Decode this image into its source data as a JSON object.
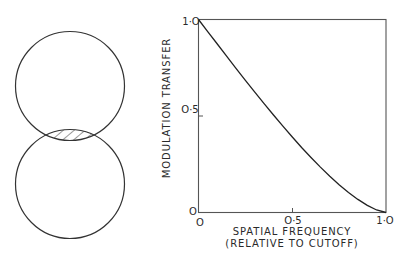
{
  "diagram": {
    "top_circle": {
      "cx": 70,
      "cy": 86,
      "r": 54.5
    },
    "bottom_circle": {
      "cx": 70,
      "cy": 184,
      "r": 54.5
    },
    "overlap_fill": "hatched",
    "stroke_color": "#333333"
  },
  "chart_data": {
    "type": "line",
    "title": "",
    "xlabel": "SPATIAL FREQUENCY",
    "xlabel_line2": "(RELATIVE TO CUTOFF)",
    "ylabel": "MODULATION TRANSFER",
    "xlim": [
      0,
      1
    ],
    "ylim": [
      0,
      1
    ],
    "grid": false,
    "x_ticks": [
      {
        "value": 0,
        "label": "O"
      },
      {
        "value": 0.5,
        "label": "O·5"
      },
      {
        "value": 1,
        "label": "1·O"
      }
    ],
    "y_ticks": [
      {
        "value": 0,
        "label": "O"
      },
      {
        "value": 0.5,
        "label": "O·5"
      },
      {
        "value": 1,
        "label": "1·O"
      }
    ],
    "series": [
      {
        "name": "MTF",
        "x": [
          0,
          0.05,
          0.1,
          0.15,
          0.2,
          0.25,
          0.3,
          0.35,
          0.4,
          0.45,
          0.5,
          0.55,
          0.6,
          0.65,
          0.7,
          0.75,
          0.8,
          0.85,
          0.9,
          0.95,
          1.0
        ],
        "values": [
          1.0,
          0.936,
          0.873,
          0.81,
          0.747,
          0.685,
          0.624,
          0.564,
          0.505,
          0.447,
          0.391,
          0.337,
          0.285,
          0.235,
          0.188,
          0.144,
          0.104,
          0.068,
          0.037,
          0.013,
          0.0
        ]
      }
    ]
  }
}
